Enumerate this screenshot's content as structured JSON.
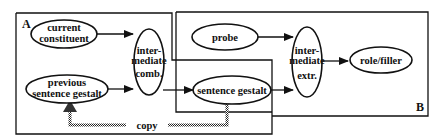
{
  "diagram": {
    "regions": {
      "A": {
        "label": "A"
      },
      "B": {
        "label": "B"
      }
    },
    "nodes": {
      "current_constituent": {
        "lines": [
          "current",
          "constituent"
        ]
      },
      "previous_sentence_gestalt": {
        "lines": [
          "previous",
          "sentence  gestalt"
        ]
      },
      "intermediate_comb": {
        "lines": [
          "inter-",
          "mediate",
          "comb."
        ]
      },
      "sentence_gestalt": {
        "lines": [
          "sentence  gestalt"
        ]
      },
      "probe": {
        "lines": [
          "probe"
        ]
      },
      "intermediate_extr": {
        "lines": [
          "inter-",
          "mediate",
          "extr."
        ]
      },
      "role_filler": {
        "lines": [
          "role/filler"
        ]
      }
    },
    "copy_label": "copy",
    "edges": [
      {
        "from": "current constituent",
        "to": "intermediate comb."
      },
      {
        "from": "previous sentence gestalt",
        "to": "intermediate comb."
      },
      {
        "from": "intermediate comb.",
        "to": "sentence gestalt"
      },
      {
        "from": "sentence gestalt",
        "to": "intermediate extr."
      },
      {
        "from": "probe",
        "to": "intermediate extr."
      },
      {
        "from": "intermediate extr.",
        "to": "role/filler"
      },
      {
        "from": "sentence gestalt",
        "to": "previous sentence gestalt",
        "style": "hatched",
        "label": "copy"
      }
    ],
    "colors": {
      "ink": "#111111",
      "background": "#ffffff",
      "copy_line": "#555555"
    }
  }
}
